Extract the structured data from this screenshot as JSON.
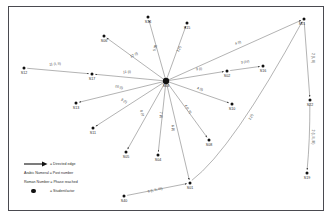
{
  "figure": {
    "type": "network-diagram",
    "border_color": "#4a4a50",
    "background": "#ffffff",
    "node_color": "#111111",
    "edge_color": "#555555"
  },
  "hub": {
    "id": "S03",
    "label": "S03",
    "x": 166,
    "y": 81
  },
  "nodes": [
    {
      "id": "S14",
      "label": "S14",
      "x": 148,
      "y": 17,
      "lx": 148,
      "ly": 20
    },
    {
      "id": "S15",
      "label": "S15",
      "x": 187,
      "y": 23,
      "lx": 187,
      "ly": 26
    },
    {
      "id": "S06",
      "label": "S06",
      "x": 104,
      "y": 36,
      "lx": 104,
      "ly": 39
    },
    {
      "id": "S21",
      "label": "S21",
      "x": 304,
      "y": 19,
      "lx": 302,
      "ly": 22
    },
    {
      "id": "S16",
      "label": "S16",
      "x": 263,
      "y": 66,
      "lx": 263,
      "ly": 69
    },
    {
      "id": "S02",
      "label": "S02",
      "x": 227,
      "y": 71,
      "lx": 227,
      "ly": 74
    },
    {
      "id": "S12",
      "label": "S12",
      "x": 24,
      "y": 68,
      "lx": 24,
      "ly": 71
    },
    {
      "id": "S17",
      "label": "S17",
      "x": 92,
      "y": 74,
      "lx": 92,
      "ly": 77
    },
    {
      "id": "S22",
      "label": "S22",
      "x": 310,
      "y": 100,
      "lx": 310,
      "ly": 103
    },
    {
      "id": "S10",
      "label": "S10",
      "x": 232,
      "y": 104,
      "lx": 232,
      "ly": 107
    },
    {
      "id": "S13",
      "label": "S13",
      "x": 76,
      "y": 103,
      "lx": 76,
      "ly": 106
    },
    {
      "id": "S11",
      "label": "S11",
      "x": 93,
      "y": 128,
      "lx": 93,
      "ly": 131
    },
    {
      "id": "S08",
      "label": "S08",
      "x": 209,
      "y": 140,
      "lx": 209,
      "ly": 143
    },
    {
      "id": "S05",
      "label": "S05",
      "x": 126,
      "y": 152,
      "lx": 126,
      "ly": 155
    },
    {
      "id": "S04",
      "label": "S04",
      "x": 158,
      "y": 155,
      "lx": 158,
      "ly": 158
    },
    {
      "id": "S19",
      "label": "S19",
      "x": 307,
      "y": 173,
      "lx": 307,
      "ly": 176
    },
    {
      "id": "S01",
      "label": "S01",
      "x": 190,
      "y": 183,
      "lx": 190,
      "ly": 186
    },
    {
      "id": "S40",
      "label": "S40",
      "x": 124,
      "y": 196,
      "lx": 124,
      "ly": 199
    }
  ],
  "edges": [
    {
      "from": "S03",
      "to": "S14",
      "label": "5 (I)",
      "lx": 155,
      "ly": 48,
      "rot": -78
    },
    {
      "from": "S03",
      "to": "S15",
      "label": "1 (I)",
      "lx": 179,
      "ly": 49,
      "rot": -62
    },
    {
      "from": "S03",
      "to": "S06",
      "label": "12 (I)",
      "lx": 134,
      "ly": 55,
      "rot": -25
    },
    {
      "from": "S03",
      "to": "S21",
      "label": "4 (I)",
      "lx": 238,
      "ly": 43,
      "rot": -22
    },
    {
      "from": "S02",
      "to": "S16",
      "label": "3 (IV)",
      "lx": 245,
      "ly": 62,
      "rot": -8
    },
    {
      "from": "S03",
      "to": "S02",
      "label": "3 (I)",
      "lx": 199,
      "ly": 69,
      "rot": -5
    },
    {
      "from": "S12",
      "to": "S17",
      "label": "11 (I, II)",
      "lx": 55,
      "ly": 64,
      "rot": -4
    },
    {
      "from": "S03",
      "to": "S17",
      "label": "11 (I)",
      "lx": 127,
      "ly": 72,
      "rot": -3
    },
    {
      "from": "S03",
      "to": "S13",
      "label": "10 (I)",
      "lx": 119,
      "ly": 87,
      "rot": 15
    },
    {
      "from": "S03",
      "to": "S11",
      "label": "9 (I)",
      "lx": 124,
      "ly": 101,
      "rot": 30
    },
    {
      "from": "S03",
      "to": "S10",
      "label": "4 (I)",
      "lx": 200,
      "ly": 89,
      "rot": 16
    },
    {
      "from": "S03",
      "to": "S08",
      "label": "4 (I, II)",
      "lx": 188,
      "ly": 109,
      "rot": 57
    },
    {
      "from": "S03",
      "to": "S05",
      "label": "8 (I)",
      "lx": 142,
      "ly": 113,
      "rot": 70
    },
    {
      "from": "S03",
      "to": "S04",
      "label": "7 (I)",
      "lx": 161,
      "ly": 115,
      "rot": 83
    },
    {
      "from": "S03",
      "to": "S01",
      "label": "6 (I)",
      "lx": 173,
      "ly": 128,
      "rot": 82
    },
    {
      "from": "S21",
      "to": "S22",
      "label": "2 (I, II)",
      "lx": 313,
      "ly": 58,
      "rot": 90
    },
    {
      "from": "S22",
      "to": "S19",
      "label": "2 (I, II, III)",
      "lx": 313,
      "ly": 137,
      "rot": 90
    },
    {
      "from": "S01",
      "to": "S21",
      "label": "2 (I)",
      "lx": 251,
      "ly": 117,
      "rot": -63
    },
    {
      "from": "S40",
      "to": "S01",
      "label": "6 (I, II, III)",
      "lx": 155,
      "ly": 190,
      "rot": -12
    }
  ],
  "legend": {
    "directed_edge": "= Directed edge",
    "arabic": "Arabic Numeral = Post number",
    "roman": "Roman Number = Phase reached",
    "actor": "= Student/actor"
  }
}
